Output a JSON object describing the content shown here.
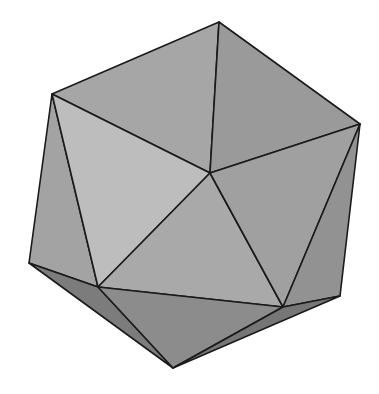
{
  "figure": {
    "background": "#ffffff",
    "edge_color": "#1a1a1a",
    "vertices": {
      "top": [
        219,
        22
      ],
      "upper_left": [
        52,
        94
      ],
      "upper_right": [
        360,
        124
      ],
      "center": [
        210,
        173
      ],
      "lower_left_outer": [
        29,
        263
      ],
      "lower_left_inner": [
        98,
        287
      ],
      "lower_right_inner": [
        283,
        307
      ],
      "lower_right_outer": [
        340,
        296
      ],
      "bottom": [
        173,
        368
      ]
    },
    "faces": [
      {
        "name": "face-top-left",
        "points": "219,22 52,94 210,173",
        "fill": "#a6a6a6"
      },
      {
        "name": "face-top-right",
        "points": "219,22 210,173 360,124",
        "fill": "#9a9a9a"
      },
      {
        "name": "face-left-outer",
        "points": "52,94 29,263 98,287",
        "fill": "#a3a3a3"
      },
      {
        "name": "face-left-inner",
        "points": "52,94 98,287 210,173",
        "fill": "#bdbdbd"
      },
      {
        "name": "face-center-lower",
        "points": "210,173 98,287 283,307",
        "fill": "#a9a9a9"
      },
      {
        "name": "face-right-inner",
        "points": "210,173 283,307 360,124",
        "fill": "#a0a0a0"
      },
      {
        "name": "face-right-outer",
        "points": "360,124 283,307 340,296",
        "fill": "#929292"
      },
      {
        "name": "face-bottom-left",
        "points": "29,263 173,368 98,287",
        "fill": "#7c7c7c"
      },
      {
        "name": "face-bottom-center",
        "points": "98,287 173,368 283,307",
        "fill": "#8c8c8c"
      },
      {
        "name": "face-bottom-right",
        "points": "283,307 173,368 340,296",
        "fill": "#767676"
      }
    ]
  }
}
